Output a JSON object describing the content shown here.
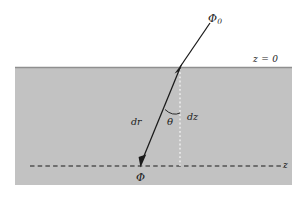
{
  "figure": {
    "background_color": "#ffffff",
    "medium_color": "#c2c2c2",
    "surface_line_color": "#8a8a8a",
    "ray_color": "#1a1a1a",
    "axis_color": "#1a1a1a",
    "dotted_color": "#f2f2f2",
    "labels": {
      "phi0": "Φ",
      "phi0_subscript": "0",
      "surface": "z = 0",
      "dr": "dr",
      "dz": "dz",
      "theta": "θ",
      "phi": "Φ",
      "z_axis": "z"
    },
    "geometry": {
      "medium_rect": {
        "x": 15,
        "y": 67,
        "width": 277,
        "height": 118
      },
      "surface_y": 67,
      "axis_y": 166,
      "axis_x_start": 30,
      "axis_x_end": 285,
      "source_point": {
        "x": 140,
        "y": 166
      },
      "surface_crossing": {
        "x": 180,
        "y": 67
      },
      "ray_end": {
        "x": 211,
        "y": 22
      },
      "vertical_dotted_x": 180,
      "angle_degrees": 22
    }
  }
}
